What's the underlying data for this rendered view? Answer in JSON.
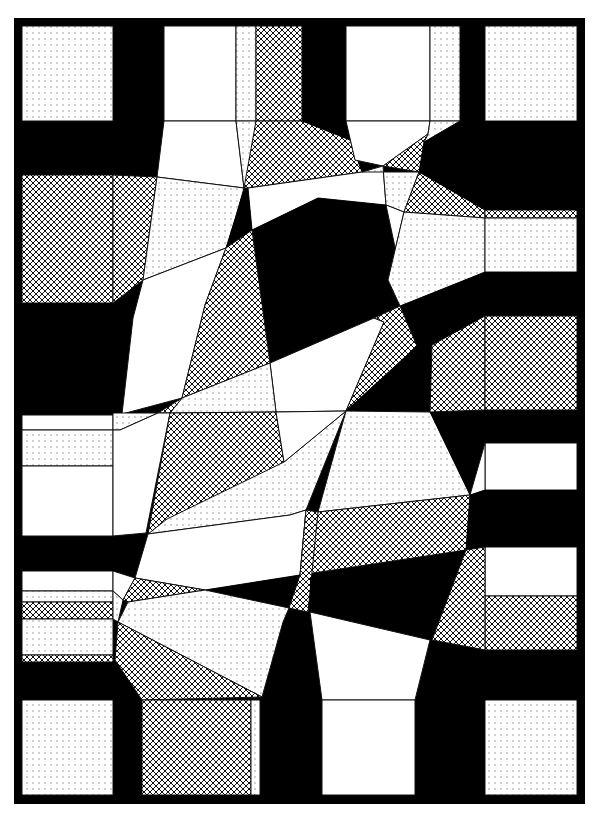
{
  "artwork": {
    "title": "Abstract geometric composition",
    "width": 597,
    "height": 817,
    "background": "#ffffff",
    "ink": "#000000",
    "paper": "#ffffff",
    "frame": {
      "x": 14,
      "y": 18,
      "width": 571,
      "height": 786
    },
    "fills": {
      "black": "#000000",
      "white": "#ffffff",
      "dots": "pattern:dots",
      "hatch": "pattern:hatch"
    },
    "polygons": [
      {
        "name": "square-top-left",
        "fill": "dots",
        "points": "22,26 113,26 113,121 22,121"
      },
      {
        "name": "square-top-right",
        "fill": "dots",
        "points": "485,26 577,26 577,121 485,121"
      },
      {
        "name": "square-bottom-left",
        "fill": "dots",
        "points": "22,700 113,700 113,795 22,795"
      },
      {
        "name": "square-bottom-right",
        "fill": "dots",
        "points": "485,700 577,700 577,795 485,795"
      },
      {
        "name": "top-col1-white",
        "fill": "white",
        "points": "164,26 236,26 236,121 164,121"
      },
      {
        "name": "top-col1-dots-strip",
        "fill": "dots",
        "points": "236,26 256,26 256,121 236,121"
      },
      {
        "name": "top-col2-hatch",
        "fill": "hatch",
        "points": "256,26 302,26 302,121 256,121"
      },
      {
        "name": "top-col3-white",
        "fill": "white",
        "points": "346,26 430,26 430,121 346,121"
      },
      {
        "name": "top-col3-dots-strip",
        "fill": "dots",
        "points": "430,26 460,26 460,121 430,121"
      },
      {
        "name": "funnel-left-white",
        "fill": "white",
        "points": "164,121 236,121 244,188 157,177"
      },
      {
        "name": "funnel-left-dots",
        "fill": "dots",
        "points": "236,121 256,121 248,188 244,188"
      },
      {
        "name": "hatch-wedge-top",
        "fill": "hatch",
        "points": "256,121 302,121 350,140 362,172 248,188 244,188"
      },
      {
        "name": "black-wedge-top",
        "fill": "black",
        "points": "302,121 346,121 355,160 383,166 362,172 350,140"
      },
      {
        "name": "funnel-right-white",
        "fill": "white",
        "points": "346,121 430,121 428,134 383,166 355,160"
      },
      {
        "name": "dots-wedge-tr",
        "fill": "dots",
        "points": "430,121 460,121 424,142 428,134"
      },
      {
        "name": "hatch-small-tr",
        "fill": "hatch",
        "points": "424,142 419,172 383,166 428,134"
      },
      {
        "name": "left-hatch-block",
        "fill": "hatch",
        "points": "22,175 113,175 113,303 22,303"
      },
      {
        "name": "left-hatch-funnel",
        "fill": "hatch",
        "points": "113,175 157,177 143,280 113,303"
      },
      {
        "name": "dots-big-left-upper",
        "fill": "dots",
        "points": "157,177 244,188 236,216 226,248 143,280"
      },
      {
        "name": "white-tri-top-center",
        "fill": "white",
        "points": "248,188 362,172 383,166 386,205 318,198 252,230"
      },
      {
        "name": "black-spike-center",
        "fill": "black",
        "points": "244,188 248,188 252,230 226,248"
      },
      {
        "name": "dots-center-top",
        "fill": "dots",
        "points": "362,172 419,172 404,212 386,205 383,166"
      },
      {
        "name": "hatch-right-band",
        "fill": "hatch",
        "points": "419,172 485,210 485,218 404,212"
      },
      {
        "name": "hatch-band-right-strip",
        "fill": "hatch",
        "points": "485,210 577,210 577,218 485,218"
      },
      {
        "name": "black-band-tr",
        "fill": "black",
        "points": "424,142 460,121 577,121 577,210 485,210 419,172"
      },
      {
        "name": "black-center-hex",
        "fill": "black",
        "points": "252,230 318,198 386,205 399,266 374,318 270,363"
      },
      {
        "name": "white-center-right",
        "fill": "white",
        "points": "386,205 404,212 388,280 399,266"
      },
      {
        "name": "dots-right-mid",
        "fill": "dots",
        "points": "404,212 485,218 485,272 400,306 388,280"
      },
      {
        "name": "dots-right-block",
        "fill": "dots",
        "points": "485,218 577,218 577,272 485,272"
      },
      {
        "name": "black-band-right-mid",
        "fill": "black",
        "points": "400,306 485,272 577,272 577,316 485,316 432,345 417,346"
      },
      {
        "name": "white-left-tall",
        "fill": "white",
        "points": "143,280 226,248 205,305 182,398 122,414 133,318"
      },
      {
        "name": "hatch-center-left-tall",
        "fill": "hatch",
        "points": "226,248 252,230 270,363 182,398 205,305"
      },
      {
        "name": "white-center-mid",
        "fill": "white",
        "points": "270,363 374,318 384,322 346,411 276,412"
      },
      {
        "name": "hatch-center-right",
        "fill": "hatch",
        "points": "374,318 400,306 417,346 346,411 384,322"
      },
      {
        "name": "black-right-wedge",
        "fill": "black",
        "points": "417,346 432,345 430,412 346,411"
      },
      {
        "name": "hatch-right-mid-funnel",
        "fill": "hatch",
        "points": "432,345 485,316 485,410 430,412"
      },
      {
        "name": "hatch-right-block",
        "fill": "hatch",
        "points": "485,316 577,316 577,410 485,410"
      },
      {
        "name": "dots-strip-cross",
        "fill": "dots",
        "points": "182,398 270,363 276,412 170,413"
      },
      {
        "name": "hatch-mini-strip",
        "fill": "hatch",
        "points": "158,413 182,398 170,413"
      },
      {
        "name": "white-left-row1",
        "fill": "white",
        "points": "22,415 113,415 113,430 22,430"
      },
      {
        "name": "dots-left-row2",
        "fill": "dots",
        "points": "22,430 113,430 113,466 22,466"
      },
      {
        "name": "white-left-row3",
        "fill": "white",
        "points": "22,466 113,466 113,536 22,536"
      },
      {
        "name": "dots-left-connector",
        "fill": "dots",
        "points": "113,413 158,413 120,430 113,430"
      },
      {
        "name": "white-left-connector",
        "fill": "white",
        "points": "113,430 120,430 158,413 170,413 146,533 113,536"
      },
      {
        "name": "hatch-big-center-left",
        "fill": "hatch",
        "points": "170,413 276,412 284,462 148,534"
      },
      {
        "name": "dots-wedge-center",
        "fill": "dots",
        "points": "284,462 346,411 346,411 306,510 290,515 148,534 167,519"
      },
      {
        "name": "white-center-narrow",
        "fill": "white",
        "points": "276,412 346,411 284,462"
      },
      {
        "name": "dots-right-big",
        "fill": "dots",
        "points": "346,411 430,412 470,495 318,512"
      },
      {
        "name": "black-right-connector",
        "fill": "black",
        "points": "430,412 577,412 577,443 485,443 470,495"
      },
      {
        "name": "white-right-row",
        "fill": "white",
        "points": "485,443 577,443 577,490 485,490"
      },
      {
        "name": "white-tiny-tri-right",
        "fill": "white",
        "points": "485,443 485,490 470,495"
      },
      {
        "name": "white-band-lower",
        "fill": "white",
        "points": "148,534 290,515 306,510 300,575 205,590 135,578"
      },
      {
        "name": "hatch-band-lower-right",
        "fill": "hatch",
        "points": "318,512 470,495 466,550 300,575 306,510"
      },
      {
        "name": "black-band-lower-right",
        "fill": "black",
        "points": "470,495 485,490 577,490 577,547 485,547 466,550"
      },
      {
        "name": "white-right-row-lower",
        "fill": "white",
        "points": "485,547 577,547 577,596 485,596"
      },
      {
        "name": "hatch-right-row-lower",
        "fill": "hatch",
        "points": "485,596 577,596 577,650 485,650"
      },
      {
        "name": "white-left-strip-a",
        "fill": "white",
        "points": "22,571 113,571 113,591 22,591"
      },
      {
        "name": "dots-left-strip-b",
        "fill": "dots",
        "points": "22,591 113,591 113,602 22,602"
      },
      {
        "name": "hatch-left-strip-c",
        "fill": "hatch",
        "points": "22,602 113,602 113,619 22,619"
      },
      {
        "name": "dots-left-strip-d",
        "fill": "dots",
        "points": "22,619 113,619 113,655 22,655"
      },
      {
        "name": "hatch-left-strip-e",
        "fill": "hatch",
        "points": "22,655 113,655 113,662 22,662"
      },
      {
        "name": "white-left-connector-low",
        "fill": "white",
        "points": "113,571 135,578 123,600 113,591"
      },
      {
        "name": "hatch-left-connector-low",
        "fill": "hatch",
        "points": "135,578 205,590 128,602 123,600"
      },
      {
        "name": "dots-left-connector-low",
        "fill": "dots",
        "points": "113,591 123,600 118,622 113,619"
      },
      {
        "name": "black-wedge-lower-center",
        "fill": "black",
        "points": "205,590 300,575 305,610 200,590"
      },
      {
        "name": "hatch-tiny-center",
        "fill": "hatch",
        "points": "300,575 306,510 318,512 308,612 289,608"
      },
      {
        "name": "black-center-lower",
        "fill": "black",
        "points": "310,578 466,550 430,640 310,612"
      },
      {
        "name": "hatch-right-funnel-low",
        "fill": "hatch",
        "points": "466,550 485,547 485,650 432,640"
      },
      {
        "name": "dots-big-lower-left",
        "fill": "dots",
        "points": "128,602 205,590 289,608 283,622 262,697 118,622"
      },
      {
        "name": "hatch-lower-left-diag",
        "fill": "hatch",
        "points": "118,622 262,697 142,700 115,660"
      },
      {
        "name": "white-lower-funnel",
        "fill": "white",
        "points": "310,612 430,640 415,700 322,700"
      },
      {
        "name": "hatch-bottom-block",
        "fill": "hatch",
        "points": "142,700 251,700 251,795 142,795"
      },
      {
        "name": "dots-bottom-strip",
        "fill": "dots",
        "points": "251,700 260,700 260,795 251,795"
      },
      {
        "name": "white-bottom-block",
        "fill": "white",
        "points": "322,700 415,700 415,795 322,795"
      }
    ]
  }
}
